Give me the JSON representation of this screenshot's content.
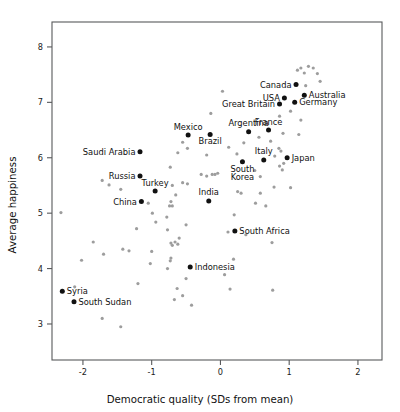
{
  "chart_data": {
    "type": "scatter",
    "title": "",
    "xlabel": "Democratic quality (SDs from mean)",
    "ylabel": "Average happiness",
    "xlim": [
      -2.45,
      2.35
    ],
    "ylim": [
      2.35,
      8.45
    ],
    "xticks": [
      -2,
      -1,
      0,
      1,
      2
    ],
    "xticklabels": [
      "-2",
      "-1",
      "0",
      "1",
      "2"
    ],
    "yticks": [
      3,
      4,
      5,
      6,
      7,
      8
    ],
    "yticklabels": [
      "3",
      "4",
      "5",
      "6",
      "7",
      "8"
    ],
    "grid": false,
    "legend": false,
    "colors": {
      "labeled_point": "#111111",
      "unlabeled_point": "#9d9d9d",
      "axis": "#58595b",
      "text": "#111111",
      "background": "#ffffff"
    },
    "labeled_points": [
      {
        "name": "Canada",
        "x": 1.1,
        "y": 7.32,
        "label_pos": "left"
      },
      {
        "name": "Australia",
        "x": 1.22,
        "y": 7.13,
        "label_pos": "right"
      },
      {
        "name": "USA",
        "x": 0.93,
        "y": 7.08,
        "label_pos": "left"
      },
      {
        "name": "Germany",
        "x": 1.08,
        "y": 7.0,
        "label_pos": "right"
      },
      {
        "name": "Great Britain",
        "x": 0.86,
        "y": 6.97,
        "label_pos": "left"
      },
      {
        "name": "Argentina",
        "x": 0.41,
        "y": 6.47,
        "label_pos": "above"
      },
      {
        "name": "France",
        "x": 0.7,
        "y": 6.5,
        "label_pos": "above"
      },
      {
        "name": "Mexico",
        "x": -0.47,
        "y": 6.41,
        "label_pos": "above"
      },
      {
        "name": "Brazil",
        "x": -0.15,
        "y": 6.42,
        "label_pos": "below"
      },
      {
        "name": "Saudi Arabia",
        "x": -1.17,
        "y": 6.11,
        "label_pos": "left"
      },
      {
        "name": "Italy",
        "x": 0.63,
        "y": 5.96,
        "label_pos": "above"
      },
      {
        "name": "Japan",
        "x": 0.97,
        "y": 6.0,
        "label_pos": "right"
      },
      {
        "name": "South Korea",
        "x": 0.32,
        "y": 5.93,
        "label_pos": "below"
      },
      {
        "name": "Russia",
        "x": -1.17,
        "y": 5.67,
        "label_pos": "left"
      },
      {
        "name": "Turkey",
        "x": -0.95,
        "y": 5.4,
        "label_pos": "above"
      },
      {
        "name": "China",
        "x": -1.15,
        "y": 5.21,
        "label_pos": "left"
      },
      {
        "name": "India",
        "x": -0.17,
        "y": 5.22,
        "label_pos": "above"
      },
      {
        "name": "South Africa",
        "x": 0.21,
        "y": 4.68,
        "label_pos": "right"
      },
      {
        "name": "Indonesia",
        "x": -0.44,
        "y": 4.03,
        "label_pos": "right"
      },
      {
        "name": "Syria",
        "x": -2.3,
        "y": 3.59,
        "label_pos": "right"
      },
      {
        "name": "South Sudan",
        "x": -2.13,
        "y": 3.4,
        "label_pos": "right"
      }
    ],
    "unlabeled_points": [
      {
        "x": 1.17,
        "y": 7.62
      },
      {
        "x": 1.28,
        "y": 7.65
      },
      {
        "x": 1.35,
        "y": 7.62
      },
      {
        "x": 1.22,
        "y": 7.53
      },
      {
        "x": 1.41,
        "y": 7.52
      },
      {
        "x": 1.12,
        "y": 7.58
      },
      {
        "x": 1.45,
        "y": 7.38
      },
      {
        "x": 1.24,
        "y": 7.3
      },
      {
        "x": 0.03,
        "y": 7.2
      },
      {
        "x": 0.86,
        "y": 6.75
      },
      {
        "x": 1.02,
        "y": 6.84
      },
      {
        "x": -0.14,
        "y": 6.8
      },
      {
        "x": 1.17,
        "y": 6.68
      },
      {
        "x": 1.14,
        "y": 6.42
      },
      {
        "x": 0.91,
        "y": 6.44
      },
      {
        "x": 0.56,
        "y": 6.37
      },
      {
        "x": -0.55,
        "y": 6.28
      },
      {
        "x": 0.73,
        "y": 6.3
      },
      {
        "x": -0.62,
        "y": 6.09
      },
      {
        "x": -0.48,
        "y": 6.17
      },
      {
        "x": 0.12,
        "y": 6.19
      },
      {
        "x": 0.34,
        "y": 6.27
      },
      {
        "x": -0.2,
        "y": 6.05
      },
      {
        "x": 0.24,
        "y": 6.07
      },
      {
        "x": 0.85,
        "y": 6.17
      },
      {
        "x": 0.88,
        "y": 6.12
      },
      {
        "x": 0.79,
        "y": 6.03
      },
      {
        "x": 0.92,
        "y": 5.9
      },
      {
        "x": -0.73,
        "y": 5.83
      },
      {
        "x": 0.9,
        "y": 5.78
      },
      {
        "x": 0.86,
        "y": 5.85
      },
      {
        "x": 0.5,
        "y": 5.77
      },
      {
        "x": -0.28,
        "y": 5.7
      },
      {
        "x": -0.2,
        "y": 5.67
      },
      {
        "x": -0.12,
        "y": 5.7
      },
      {
        "x": -0.08,
        "y": 5.7
      },
      {
        "x": -0.04,
        "y": 5.72
      },
      {
        "x": 0.58,
        "y": 5.66
      },
      {
        "x": -1.72,
        "y": 5.59
      },
      {
        "x": -1.62,
        "y": 5.51
      },
      {
        "x": -1.45,
        "y": 5.43
      },
      {
        "x": -0.7,
        "y": 5.5
      },
      {
        "x": -0.55,
        "y": 5.55
      },
      {
        "x": -0.48,
        "y": 5.53
      },
      {
        "x": 0.78,
        "y": 5.47
      },
      {
        "x": 1.02,
        "y": 5.46
      },
      {
        "x": -0.65,
        "y": 5.33
      },
      {
        "x": 0.25,
        "y": 5.39
      },
      {
        "x": 0.3,
        "y": 5.36
      },
      {
        "x": 0.58,
        "y": 5.36
      },
      {
        "x": -1.05,
        "y": 5.18
      },
      {
        "x": -0.72,
        "y": 5.21
      },
      {
        "x": -0.74,
        "y": 5.13
      },
      {
        "x": -0.7,
        "y": 5.13
      },
      {
        "x": 0.66,
        "y": 5.13
      },
      {
        "x": 0.51,
        "y": 5.18
      },
      {
        "x": -2.32,
        "y": 5.01
      },
      {
        "x": -0.99,
        "y": 5.0
      },
      {
        "x": 0.2,
        "y": 4.97
      },
      {
        "x": -0.78,
        "y": 4.93
      },
      {
        "x": -0.94,
        "y": 4.84
      },
      {
        "x": -0.5,
        "y": 4.79
      },
      {
        "x": -1.22,
        "y": 4.72
      },
      {
        "x": -0.77,
        "y": 4.7
      },
      {
        "x": 0.11,
        "y": 4.66
      },
      {
        "x": 0.37,
        "y": 4.61
      },
      {
        "x": -0.6,
        "y": 4.55
      },
      {
        "x": -0.66,
        "y": 4.48
      },
      {
        "x": -0.72,
        "y": 4.46
      },
      {
        "x": -0.7,
        "y": 4.42
      },
      {
        "x": -0.62,
        "y": 4.44
      },
      {
        "x": 0.75,
        "y": 4.47
      },
      {
        "x": -1.85,
        "y": 4.48
      },
      {
        "x": -1.42,
        "y": 4.35
      },
      {
        "x": -1.33,
        "y": 4.32
      },
      {
        "x": -1.0,
        "y": 4.31
      },
      {
        "x": -1.7,
        "y": 4.26
      },
      {
        "x": -0.72,
        "y": 4.19
      },
      {
        "x": -0.73,
        "y": 4.14
      },
      {
        "x": -1.02,
        "y": 4.09
      },
      {
        "x": 0.19,
        "y": 4.17
      },
      {
        "x": -2.02,
        "y": 4.15
      },
      {
        "x": -0.77,
        "y": 4.0
      },
      {
        "x": 0.06,
        "y": 3.89
      },
      {
        "x": -0.5,
        "y": 3.82
      },
      {
        "x": -1.2,
        "y": 3.73
      },
      {
        "x": -2.12,
        "y": 3.67
      },
      {
        "x": -0.63,
        "y": 3.64
      },
      {
        "x": 0.14,
        "y": 3.63
      },
      {
        "x": 0.76,
        "y": 3.61
      },
      {
        "x": -0.55,
        "y": 3.51
      },
      {
        "x": -0.67,
        "y": 3.44
      },
      {
        "x": -0.42,
        "y": 3.34
      },
      {
        "x": -1.72,
        "y": 3.1
      },
      {
        "x": -1.45,
        "y": 2.95
      }
    ]
  },
  "axis": {
    "x_title": "Democratic quality (SDs from mean)",
    "y_title": "Average happiness"
  }
}
